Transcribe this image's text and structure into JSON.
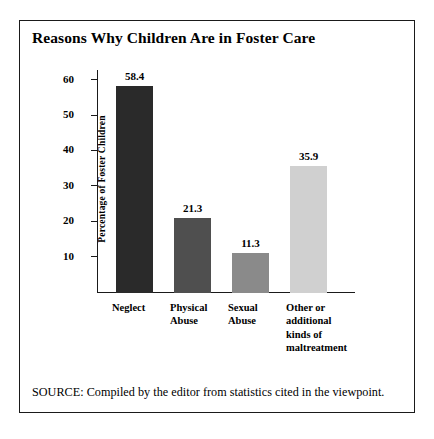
{
  "figure": {
    "title": "Reasons Why Children Are in Foster Care",
    "source_note": "SOURCE: Compiled by the editor from statistics cited in the viewpoint.",
    "border_color": "#1a1a1a",
    "background": "#ffffff"
  },
  "chart_data": {
    "type": "bar",
    "title": "Reasons Why Children Are in Foster Care",
    "xlabel": "",
    "ylabel": "Percentage of Foster Children",
    "ylim": [
      0,
      63
    ],
    "yticks": [
      10,
      20,
      30,
      40,
      50,
      60
    ],
    "ytick_labels": [
      "10",
      "20",
      "30",
      "40",
      "50",
      "60"
    ],
    "grid": false,
    "legend": "none",
    "categories": [
      "Neglect",
      "Physical\nAbuse",
      "Sexual\nAbuse",
      "Other or\nadditional\nkinds of\nmaltreatment"
    ],
    "values": [
      58.4,
      21.3,
      11.3,
      35.9
    ],
    "value_labels": [
      "58.4",
      "21.3",
      "11.3",
      "35.9"
    ],
    "bar_colors": [
      "#2a2a2a",
      "#4f4f4f",
      "#8a8a8a",
      "#d0d0d0"
    ]
  }
}
